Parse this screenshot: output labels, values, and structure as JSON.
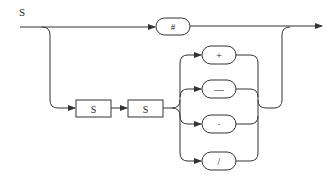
{
  "diagram": {
    "type": "syntax-railroad-diagram",
    "title": "S",
    "main_path": {
      "terminal": "#"
    },
    "sequence_boxes": [
      "S",
      "S"
    ],
    "choice_terminals": [
      "+",
      "—",
      "·",
      "/"
    ],
    "colors": {
      "stroke": "#333333",
      "text": "#222222",
      "background": "#ffffff"
    }
  }
}
